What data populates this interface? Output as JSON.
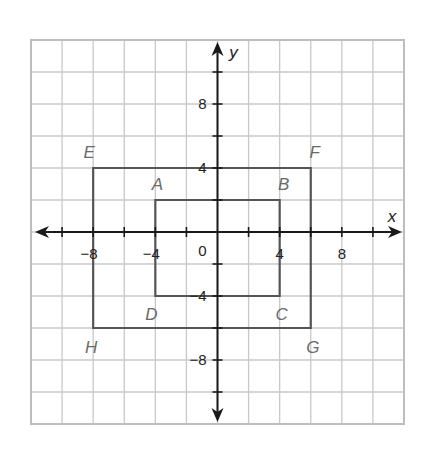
{
  "chart_data": {
    "type": "coordinate-plane",
    "title": "",
    "xlabel": "x",
    "ylabel": "y",
    "xlim": [
      -12,
      12
    ],
    "ylim": [
      -12,
      12
    ],
    "grid": true,
    "grid_step": 2,
    "x_tick_labels": [
      {
        "value": -8,
        "label": "−8"
      },
      {
        "value": -4,
        "label": "−4"
      },
      {
        "value": 4,
        "label": "4"
      },
      {
        "value": 8,
        "label": "8"
      }
    ],
    "y_tick_labels": [
      {
        "value": 8,
        "label": "8"
      },
      {
        "value": 4,
        "label": "4"
      },
      {
        "value": -4,
        "label": "−4"
      },
      {
        "value": -8,
        "label": "−8"
      }
    ],
    "origin_label": "0",
    "shapes": [
      {
        "name": "ABCD",
        "type": "rectangle",
        "vertices": [
          {
            "label": "A",
            "x": -4,
            "y": 2
          },
          {
            "label": "B",
            "x": 4,
            "y": 2
          },
          {
            "label": "C",
            "x": 4,
            "y": -4
          },
          {
            "label": "D",
            "x": -4,
            "y": -4
          }
        ]
      },
      {
        "name": "EFGH",
        "type": "rectangle",
        "vertices": [
          {
            "label": "E",
            "x": -8,
            "y": 4
          },
          {
            "label": "F",
            "x": 6,
            "y": 4
          },
          {
            "label": "G",
            "x": 6,
            "y": -6
          },
          {
            "label": "H",
            "x": -8,
            "y": -6
          }
        ]
      }
    ],
    "colors": {
      "grid": "#c8c8c8",
      "axes": "#1a1a1a",
      "shapes": "#555555",
      "vertex_labels": "#6a6a6a"
    }
  }
}
